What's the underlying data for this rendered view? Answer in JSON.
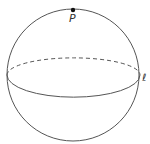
{
  "figure": {
    "type": "sphere-with-great-circle",
    "point_label": "P",
    "line_label": "ℓ",
    "colors": {
      "stroke": "#555555",
      "point": "#111111",
      "background": "#ffffff"
    }
  }
}
